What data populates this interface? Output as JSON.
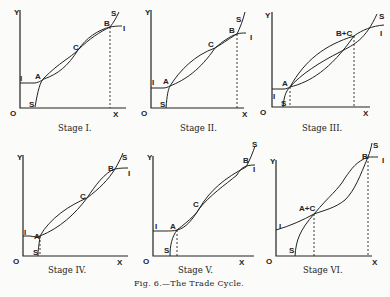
{
  "figure": {
    "caption": "Fig. 6.—The Trade Cycle.",
    "panels": [
      {
        "stage": "Stage I.",
        "labels": {
          "y": "Y",
          "x": "X",
          "origin": "O",
          "s_low": "S",
          "s_high": "S",
          "i_left": "I",
          "i_right": "I",
          "points": [
            "A",
            "C",
            "B"
          ]
        }
      },
      {
        "stage": "Stage II.",
        "labels": {
          "y": "Y",
          "x": "X",
          "origin": "O",
          "s_low": "S",
          "s_high": "S",
          "i_left": "I",
          "i_right": "I",
          "points": [
            "A",
            "C",
            "B"
          ]
        }
      },
      {
        "stage": "Stage III.",
        "labels": {
          "y": "Y",
          "x": "X",
          "origin": "O",
          "s_low": "S",
          "s_high": "S",
          "i_left": "I",
          "i_right": "I",
          "points": [
            "A",
            "B+C"
          ]
        }
      },
      {
        "stage": "Stage IV.",
        "labels": {
          "y": "Y",
          "x": "X",
          "origin": "O",
          "s_low": "S",
          "s_high": "S",
          "i_left": "I",
          "i_right": "I",
          "points": [
            "A",
            "C",
            "B"
          ]
        }
      },
      {
        "stage": "Stage V.",
        "labels": {
          "y": "Y",
          "x": "X",
          "origin": "O",
          "s_low": "S",
          "s_high": "S",
          "i_left": "I",
          "i_right": "I",
          "points": [
            "A",
            "C",
            "B"
          ]
        }
      },
      {
        "stage": "Stage VI.",
        "labels": {
          "y": "Y",
          "x": "X",
          "origin": "O",
          "s_low": "S",
          "s_high": "S",
          "i_left": "I",
          "i_right": "I",
          "points": [
            "A+C",
            "B"
          ]
        }
      }
    ]
  }
}
